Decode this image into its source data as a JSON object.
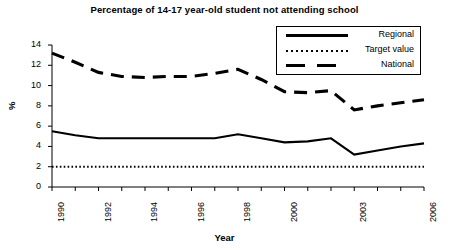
{
  "chart_data": {
    "type": "line",
    "title": "Percentage of 14-17 year-old student not attending school",
    "xlabel": "Year",
    "ylabel": "%",
    "x": [
      1990,
      1991,
      1992,
      1993,
      1994,
      1995,
      1996,
      1997,
      1998,
      1999,
      2000,
      2001,
      2002,
      2003,
      2004,
      2005,
      2006
    ],
    "xtick_labels": [
      "1990",
      "",
      "1992",
      "",
      "1994",
      "",
      "1996",
      "",
      "1998",
      "",
      "2000",
      "",
      "",
      "2003",
      "",
      "",
      "2006"
    ],
    "xlim": [
      1990,
      2006
    ],
    "ylim": [
      0,
      14
    ],
    "ytick_labels": [
      "0",
      "2",
      "4",
      "6",
      "8",
      "10",
      "12",
      "14"
    ],
    "ytick_values": [
      0,
      2,
      4,
      6,
      8,
      10,
      12,
      14
    ],
    "grid": false,
    "legend_position": "top-right",
    "series": [
      {
        "name": "Regional",
        "style": "solid",
        "color": "#000000",
        "values": [
          5.5,
          5.1,
          4.8,
          4.8,
          4.8,
          4.8,
          4.8,
          4.8,
          5.2,
          4.8,
          4.4,
          4.5,
          4.8,
          3.2,
          3.6,
          4.0,
          4.3
        ]
      },
      {
        "name": "Target value",
        "style": "dotted",
        "color": "#000000",
        "values": [
          2.0,
          2.0,
          2.0,
          2.0,
          2.0,
          2.0,
          2.0,
          2.0,
          2.0,
          2.0,
          2.0,
          2.0,
          2.0,
          2.0,
          2.0,
          2.0,
          2.0
        ]
      },
      {
        "name": "National",
        "style": "dashed",
        "color": "#000000",
        "values": [
          13.2,
          12.3,
          11.3,
          10.9,
          10.8,
          10.9,
          10.9,
          11.2,
          11.6,
          10.6,
          9.4,
          9.3,
          9.5,
          7.6,
          8.0,
          8.3,
          8.6
        ]
      }
    ]
  },
  "legend": {
    "items": [
      {
        "label": "Regional",
        "swatch": "solid-line-swatch"
      },
      {
        "label": "Target value",
        "swatch": "dotted-line-swatch"
      },
      {
        "label": "National",
        "swatch": "dashed-line-swatch"
      }
    ]
  }
}
